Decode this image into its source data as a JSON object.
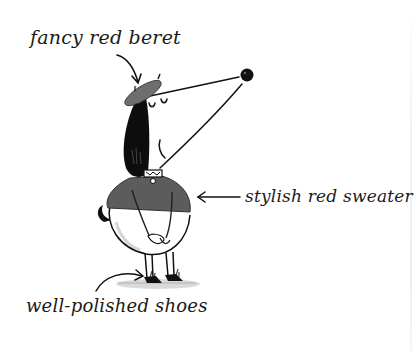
{
  "illustration": {
    "subject": "dog-character",
    "palette": {
      "background": "#ffffff",
      "ink": "#111111",
      "beret": "#6e6e6e",
      "sweater": "#5c5c5c",
      "hair": "#0d0d0d",
      "shadow": "#bdbdbd"
    }
  },
  "labels": {
    "beret": "fancy red beret",
    "sweater": "stylish red sweater",
    "shoes": "well-polished shoes"
  }
}
